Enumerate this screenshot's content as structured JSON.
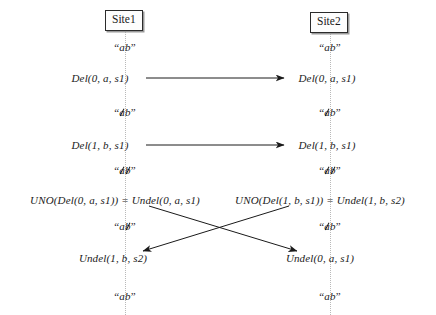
{
  "figure": {
    "type": "sequence-diagram",
    "width": 436,
    "height": 315,
    "background": "#ffffff",
    "line_color": "#1a1a1a",
    "lifeline_color": "#b9b9b9"
  },
  "sites": [
    {
      "label": "Site1",
      "x": 125
    },
    {
      "label": "Site2",
      "x": 330
    }
  ],
  "left_column": {
    "states": [
      {
        "y": 47,
        "open": "“",
        "chars": [
          {
            "c": "a",
            "struck": false
          },
          {
            "c": "b",
            "struck": false
          }
        ],
        "close": "”"
      },
      {
        "y": 112,
        "open": "“",
        "chars": [
          {
            "c": "a",
            "struck": true
          },
          {
            "c": "b",
            "struck": false
          }
        ],
        "close": "”"
      },
      {
        "y": 170,
        "open": "“",
        "chars": [
          {
            "c": "a",
            "struck": true
          },
          {
            "c": "b",
            "struck": true
          }
        ],
        "close": "”"
      },
      {
        "y": 226,
        "open": "“",
        "chars": [
          {
            "c": "a",
            "struck": false
          },
          {
            "c": "b",
            "struck": true
          }
        ],
        "close": "”"
      },
      {
        "y": 296,
        "open": "“",
        "chars": [
          {
            "c": "a",
            "struck": false
          },
          {
            "c": "b",
            "struck": false
          }
        ],
        "close": "”"
      }
    ],
    "operations": [
      {
        "y": 78,
        "x": 100,
        "text": "Del(0, a, s1)"
      },
      {
        "y": 145,
        "x": 100,
        "text": "Del(1, b, s1)"
      },
      {
        "y": 200,
        "x": 115,
        "text": "UNO(Del(0, a, s1)) = Undel(0, a, s1)"
      },
      {
        "y": 258,
        "x": 113,
        "text": "Undel(1, b, s2)"
      }
    ]
  },
  "right_column": {
    "states": [
      {
        "y": 47,
        "open": "“",
        "chars": [
          {
            "c": "a",
            "struck": false
          },
          {
            "c": "b",
            "struck": false
          }
        ],
        "close": "”"
      },
      {
        "y": 112,
        "open": "“",
        "chars": [
          {
            "c": "a",
            "struck": true
          },
          {
            "c": "b",
            "struck": false
          }
        ],
        "close": "”"
      },
      {
        "y": 170,
        "open": "“",
        "chars": [
          {
            "c": "a",
            "struck": true
          },
          {
            "c": "b",
            "struck": true
          }
        ],
        "close": "”"
      },
      {
        "y": 226,
        "open": "“",
        "chars": [
          {
            "c": "a",
            "struck": true
          },
          {
            "c": "b",
            "struck": false
          }
        ],
        "close": "”"
      },
      {
        "y": 296,
        "open": "“",
        "chars": [
          {
            "c": "a",
            "struck": false
          },
          {
            "c": "b",
            "struck": false
          }
        ],
        "close": "”"
      }
    ],
    "operations": [
      {
        "y": 78,
        "x": 327,
        "text": "Del(0, a, s1)"
      },
      {
        "y": 145,
        "x": 327,
        "text": "Del(1, b, s1)"
      },
      {
        "y": 200,
        "x": 320,
        "text": "UNO(Del(1, b, s1)) = Undel(1, b, s2)"
      },
      {
        "y": 258,
        "x": 320,
        "text": "Undel(0, a, s1)"
      }
    ]
  },
  "arrows": [
    {
      "name": "del0-left-to-right",
      "x1": 146,
      "y1": 78,
      "x2": 284,
      "y2": 78
    },
    {
      "name": "del1-left-to-right",
      "x1": 146,
      "y1": 145,
      "x2": 284,
      "y2": 145
    },
    {
      "name": "undel0-left-to-right",
      "x1": 149,
      "y1": 206,
      "x2": 297,
      "y2": 251
    },
    {
      "name": "undel1-right-to-left",
      "x1": 289,
      "y1": 206,
      "x2": 143,
      "y2": 251
    }
  ],
  "lifelines": [
    {
      "x": 125,
      "y1": 28,
      "y2": 315
    },
    {
      "x": 330,
      "y1": 30,
      "y2": 315
    }
  ]
}
